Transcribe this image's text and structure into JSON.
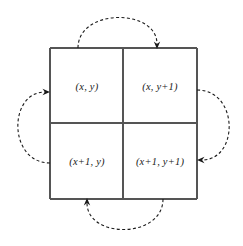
{
  "figure": {
    "name": "grid-rotation-diagram",
    "width": 243,
    "height": 246,
    "background_color": "#ffffff"
  },
  "grid": {
    "stroke_color": "#555555",
    "stroke_width": 1.2,
    "left": 50,
    "top": 48,
    "right": 197,
    "bottom": 199,
    "mid_x": 123,
    "mid_y": 123,
    "cells": [
      {
        "id": "top-left",
        "label": "(x, y)",
        "cx": 87,
        "cy": 86
      },
      {
        "id": "top-right",
        "label": "(x, y+1)",
        "cx": 160,
        "cy": 86
      },
      {
        "id": "bottom-left",
        "label": "(x+1, y)",
        "cx": 87,
        "cy": 161
      },
      {
        "id": "bottom-right",
        "label": "(x+1, y+1)",
        "cx": 160,
        "cy": 161
      }
    ]
  },
  "arrows": {
    "stroke_color": "#1a1a1a",
    "stroke_width": 1.1,
    "dash_pattern": "3,2.4",
    "items": [
      {
        "id": "top-arrow",
        "description": "dashed arc over the top of the square from top-left cell to top-right cell",
        "from_cell": "top-left",
        "to_cell": "top-right",
        "path": "M 78 48 C 78 8, 157 8, 157 44",
        "arrow_tip": {
          "x": 157,
          "y": 49
        },
        "arrow_angle": 90
      },
      {
        "id": "right-arrow",
        "description": "dashed arc around the right of the square from top-right cell to bottom-right cell",
        "from_cell": "top-right",
        "to_cell": "bottom-right",
        "path": "M 197 90 C 239 90, 239 160, 202 160",
        "arrow_tip": {
          "x": 197,
          "y": 160
        },
        "arrow_angle": 180
      },
      {
        "id": "bottom-arrow",
        "description": "dashed arc under the bottom of the square from bottom-right cell to bottom-left cell",
        "from_cell": "bottom-right",
        "to_cell": "bottom-left",
        "path": "M 163 199 C 163 239, 87 239, 87 203",
        "arrow_tip": {
          "x": 87,
          "y": 198
        },
        "arrow_angle": 270
      },
      {
        "id": "left-arrow",
        "description": "dashed arc around the left of the square from bottom-left cell to top-left cell",
        "from_cell": "bottom-left",
        "to_cell": "top-left",
        "path": "M 50 163 C 8 163, 8 92, 45 92",
        "arrow_tip": {
          "x": 50,
          "y": 92
        },
        "arrow_angle": 0
      }
    ]
  }
}
